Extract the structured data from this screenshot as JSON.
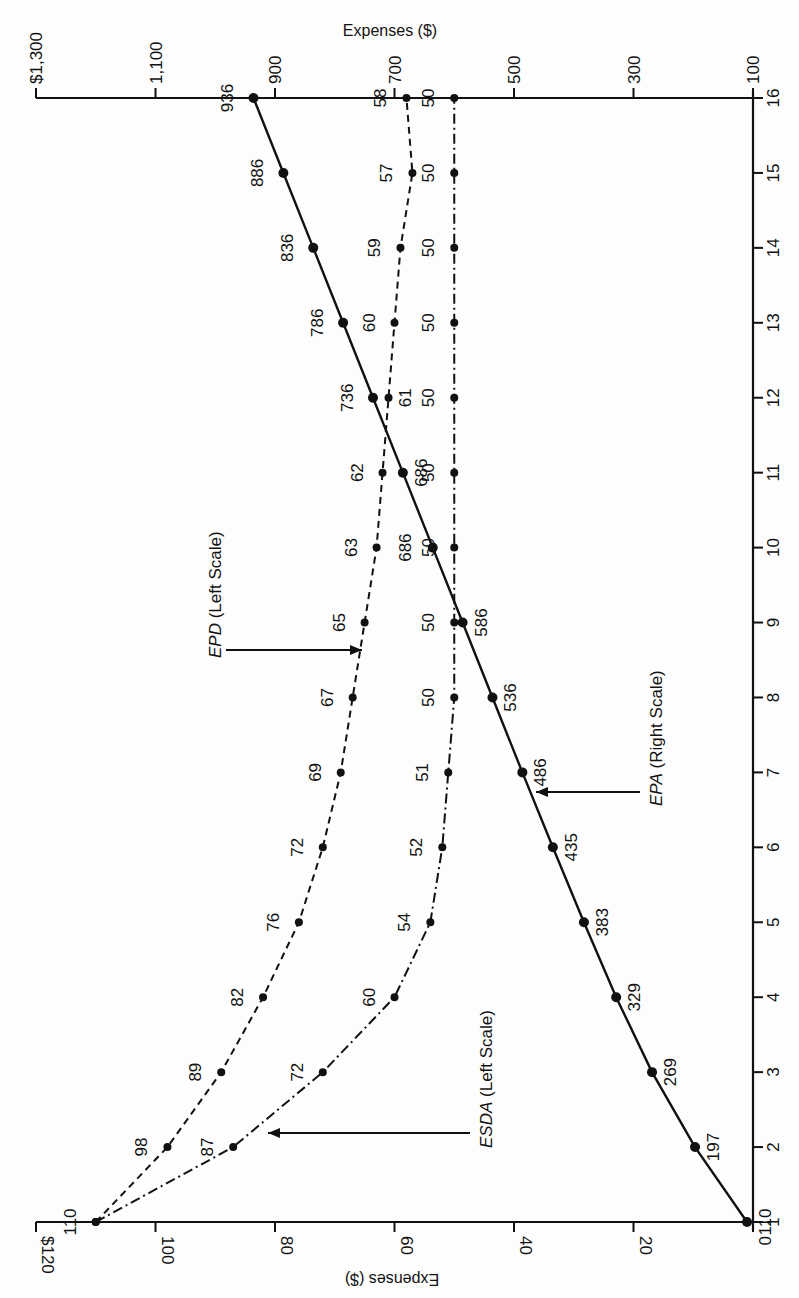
{
  "chart_data": {
    "type": "line",
    "orientation": "rotated-90-ccw",
    "title": "",
    "x": [
      1,
      2,
      3,
      4,
      5,
      6,
      7,
      8,
      9,
      10,
      11,
      12,
      13,
      14,
      15,
      16
    ],
    "xlabel": "",
    "x_ticks": [
      "1",
      "2",
      "3",
      "4",
      "5",
      "6",
      "7",
      "8",
      "9",
      "10",
      "11",
      "12",
      "13",
      "14",
      "15",
      "16"
    ],
    "left_axis": {
      "label": "Expenses ($)",
      "ticks": [
        "$120",
        "100",
        "80",
        "60",
        "40",
        "20",
        "0"
      ],
      "tick_values": [
        120,
        100,
        80,
        60,
        40,
        20,
        0
      ],
      "range": [
        0,
        120
      ]
    },
    "right_axis": {
      "label": "Expenses ($)",
      "ticks": [
        "$1,300",
        "1,100",
        "900",
        "700",
        "500",
        "300",
        "100"
      ],
      "tick_values": [
        1300,
        1100,
        900,
        700,
        500,
        300,
        100
      ],
      "range": [
        100,
        1300
      ]
    },
    "series": [
      {
        "name": "EPD",
        "legend": "EPD (Left Scale)",
        "legend_name": "EPD",
        "legend_suffix": " (Left Scale)",
        "axis": "left",
        "style": "dashed",
        "values": [
          110,
          98,
          89,
          82,
          76,
          72,
          69,
          67,
          65,
          63,
          62,
          61,
          60,
          59,
          57,
          58
        ],
        "labels": [
          "110",
          "98",
          "89",
          "82",
          "76",
          "72",
          "69",
          "67",
          "65",
          "63",
          "62",
          "61",
          "60",
          "59",
          "57",
          "58"
        ]
      },
      {
        "name": "ESDA",
        "legend": "ESDA (Left Scale)",
        "legend_name": "ESDA",
        "legend_suffix": " (Left Scale)",
        "axis": "left",
        "style": "dash-dot",
        "values": [
          110,
          87,
          72,
          60,
          54,
          52,
          51,
          50,
          50,
          50,
          50,
          50,
          50,
          50,
          50,
          50
        ],
        "labels": [
          "",
          "87",
          "72",
          "60",
          "54",
          "52",
          "51",
          "50",
          "50",
          "50",
          "50",
          "50",
          "50",
          "50",
          "50",
          "50"
        ]
      },
      {
        "name": "EPA",
        "legend": "EPA (Right Scale)",
        "legend_name": "EPA",
        "legend_suffix": " (Right Scale)",
        "axis": "right",
        "style": "solid",
        "values": [
          110,
          197,
          269,
          329,
          383,
          435,
          486,
          536,
          586,
          636,
          686,
          736,
          786,
          836,
          886,
          936
        ],
        "labels": [
          "110",
          "197",
          "269",
          "329",
          "383",
          "435",
          "486",
          "536",
          "586",
          "686",
          "686",
          "736",
          "786",
          "836",
          "886",
          "936"
        ]
      }
    ],
    "annotations": [
      {
        "series": "EPD",
        "text": "EPD (Left Scale)",
        "arrow_at_year": 8.85
      },
      {
        "series": "ESDA",
        "text": "ESDA (Left Scale)",
        "arrow_at_year": 2.2
      },
      {
        "series": "EPA",
        "text": "EPA (Right Scale)",
        "arrow_at_year": 6.75
      }
    ],
    "grid": false,
    "legend_position": "inline-annotations"
  },
  "axes": {
    "top_title": "Expenses ($)",
    "bottom_title": "Expenses ($)"
  },
  "colors": {
    "ink": "#111111",
    "background": "#fdfdfd"
  }
}
